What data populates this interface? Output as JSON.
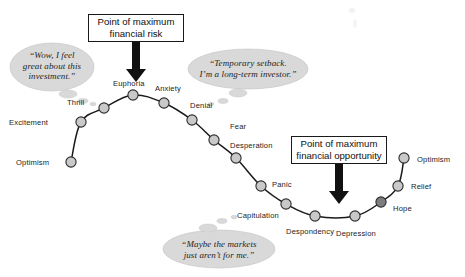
{
  "figure": {
    "title_semantic": "cycle-of-investor-emotions",
    "background_color": "#ffffff",
    "line_color": "#1a1a1a",
    "node_fill": "#c9c9c9",
    "node_fill_dark": "#7d7d7d",
    "node_stroke": "#2b2b2b",
    "bubble_fill": "#d9d9d9",
    "arrow_color": "#111111"
  },
  "callouts": [
    {
      "id": "max-risk",
      "line1": "Point of maximum",
      "line2": "financial risk",
      "text": "Point of maximum financial risk",
      "box": {
        "x": 88,
        "y": 14,
        "w": 96,
        "h": 28
      },
      "arrow": {
        "x": 136,
        "y1": 42,
        "y2": 82
      }
    },
    {
      "id": "max-opportunity",
      "line1": "Point of maximum",
      "line2": "financial opportunity",
      "text": "Point of maximum financial opportunity",
      "box": {
        "x": 291,
        "y": 136,
        "w": 96,
        "h": 28
      },
      "arrow": {
        "x": 339,
        "y1": 164,
        "y2": 204
      }
    }
  ],
  "thought_bubbles": [
    {
      "id": "bubble-optimistic",
      "text": "“Wow, I feel\ngreat about this\ninvestment.”",
      "ellipse": {
        "cx": 52,
        "cy": 67,
        "rx": 42,
        "ry": 24
      },
      "tail": [
        {
          "cx": 68,
          "cy": 94,
          "rx": 9,
          "ry": 4
        },
        {
          "cx": 83,
          "cy": 101,
          "rx": 5,
          "ry": 2.4
        },
        {
          "cx": 93,
          "cy": 104,
          "rx": 3,
          "ry": 1.8
        }
      ],
      "text_box": {
        "x": 12,
        "y": 50,
        "w": 80
      }
    },
    {
      "id": "bubble-setback",
      "text": "“Temporary setback.\nI’m a long-term investor.”",
      "ellipse": {
        "cx": 248,
        "cy": 69,
        "rx": 60,
        "ry": 20
      },
      "tail": [
        {
          "cx": 238,
          "cy": 93,
          "rx": 9,
          "ry": 4
        },
        {
          "cx": 223,
          "cy": 101,
          "rx": 5,
          "ry": 2.4
        },
        {
          "cx": 211,
          "cy": 104,
          "rx": 3,
          "ry": 1.8
        }
      ],
      "text_box": {
        "x": 186,
        "y": 58,
        "w": 124
      }
    },
    {
      "id": "bubble-capitulation",
      "text": "“Maybe the markets\njust aren’t for me.”",
      "ellipse": {
        "cx": 219,
        "cy": 249,
        "rx": 56,
        "ry": 19
      },
      "tail": [
        {
          "cx": 208,
          "cy": 228,
          "rx": 9,
          "ry": 4
        },
        {
          "cx": 222,
          "cy": 221,
          "rx": 5,
          "ry": 2.4
        },
        {
          "cx": 234,
          "cy": 217,
          "rx": 3,
          "ry": 1.8
        }
      ],
      "text_box": {
        "x": 163,
        "y": 239,
        "w": 112
      }
    }
  ],
  "chart_data": {
    "type": "line",
    "xlabel": "",
    "ylabel": "",
    "grid": false,
    "legend": "none",
    "series": [
      {
        "name": "Investor emotion",
        "points": [
          {
            "label": "Optimism",
            "x": 71,
            "y": 162,
            "label_x": 16,
            "label_y": 159,
            "label_anchor": "left",
            "shade": "light"
          },
          {
            "label": "Excitement",
            "x": 81,
            "y": 122,
            "label_x": 9,
            "label_y": 119,
            "label_anchor": "left",
            "shade": "light"
          },
          {
            "label": "Thrill",
            "x": 104,
            "y": 108,
            "label_x": 67,
            "label_y": 99,
            "label_anchor": "left",
            "shade": "light"
          },
          {
            "label": "Euphoria",
            "x": 133,
            "y": 95,
            "label_x": 113,
            "label_y": 80,
            "label_anchor": "left",
            "shade": "light"
          },
          {
            "label": "Anxiety",
            "x": 164,
            "y": 103,
            "label_x": 155,
            "label_y": 85,
            "label_anchor": "left",
            "shade": "light"
          },
          {
            "label": "Denial",
            "x": 192,
            "y": 120,
            "label_x": 190,
            "label_y": 102,
            "label_anchor": "left",
            "shade": "light"
          },
          {
            "label": "Fear",
            "x": 214,
            "y": 140,
            "label_x": 230,
            "label_y": 123,
            "label_anchor": "left",
            "shade": "light"
          },
          {
            "label": "Desperation",
            "x": 236,
            "y": 158,
            "label_x": 230,
            "label_y": 142,
            "label_anchor": "left",
            "shade": "light"
          },
          {
            "label": "Panic",
            "x": 261,
            "y": 186,
            "label_x": 272,
            "label_y": 181,
            "label_anchor": "left",
            "shade": "light"
          },
          {
            "label": "Capitulation",
            "x": 286,
            "y": 204,
            "label_x": 237,
            "label_y": 212,
            "label_anchor": "left",
            "shade": "light"
          },
          {
            "label": "Despondency",
            "x": 315,
            "y": 216,
            "label_x": 286,
            "label_y": 228,
            "label_anchor": "left",
            "shade": "light"
          },
          {
            "label": "Depression",
            "x": 355,
            "y": 216,
            "label_x": 336,
            "label_y": 230,
            "label_anchor": "left",
            "shade": "light"
          },
          {
            "label": "Hope",
            "x": 381,
            "y": 202,
            "label_x": 393,
            "label_y": 205,
            "label_anchor": "left",
            "shade": "dark"
          },
          {
            "label": "Relief",
            "x": 398,
            "y": 186,
            "label_x": 411,
            "label_y": 183,
            "label_anchor": "left",
            "shade": "light"
          },
          {
            "label": "Optimism",
            "x": 404,
            "y": 158,
            "label_x": 417,
            "label_y": 156,
            "label_anchor": "left",
            "shade": "light"
          }
        ]
      }
    ],
    "annotations": [
      "Point of maximum financial risk",
      "Point of maximum financial opportunity",
      "“Wow, I feel great about this investment.”",
      "“Temporary setback. I’m a long-term investor.”",
      "“Maybe the markets just aren’t for me.”"
    ]
  }
}
